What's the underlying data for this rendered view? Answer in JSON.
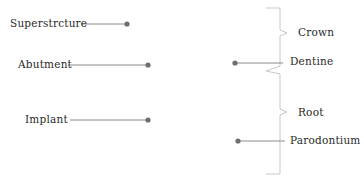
{
  "diagram": {
    "left_labels": [
      {
        "id": "superstructure",
        "text": "Superstrcture",
        "x": 10,
        "y": 18,
        "line_x1": 81,
        "line_x2": 127,
        "line_y": 24
      },
      {
        "id": "abutment",
        "text": "Abutment",
        "x": 18,
        "y": 58,
        "line_x1": 68,
        "line_x2": 148,
        "line_y": 65
      },
      {
        "id": "implant",
        "text": "Implant",
        "x": 25,
        "y": 114,
        "line_x1": 70,
        "line_x2": 148,
        "line_y": 120
      }
    ],
    "right_labels": [
      {
        "id": "crown",
        "text": "Crown",
        "x": 298,
        "y": 28
      },
      {
        "id": "dentine",
        "text": "Dentine",
        "x": 290,
        "y": 56
      },
      {
        "id": "root",
        "text": "Root",
        "x": 298,
        "y": 107
      },
      {
        "id": "parodontium",
        "text": "Parodontium",
        "x": 290,
        "y": 135
      }
    ],
    "right_pointers": [
      {
        "id": "dentine-pointer",
        "dot_x": 235,
        "y": 63,
        "line_x2": 283
      },
      {
        "id": "parodontium-pointer",
        "dot_x": 238,
        "y": 141,
        "line_x2": 285
      }
    ],
    "colors": {
      "line": "#8a8a8a",
      "dot": "#6e6e6e",
      "bracket": "#c8c8c8",
      "text": "#2a2a2a"
    }
  }
}
